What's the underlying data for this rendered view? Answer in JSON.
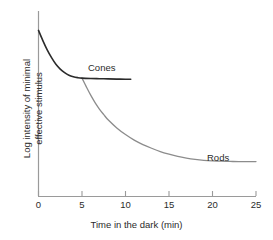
{
  "chart_data": {
    "type": "line",
    "title": "",
    "xlabel": "Time in the dark (min)",
    "ylabel": "Log intensity of minimal effective stimulus",
    "ylabel_line1": "Log intensity of minimal",
    "ylabel_line2": "effective stimulus",
    "xlim": [
      0,
      25
    ],
    "ylim": [
      0,
      1
    ],
    "xticks": [
      0,
      5,
      10,
      15,
      20,
      25
    ],
    "xtick_labels": [
      "0",
      "5",
      "10",
      "15",
      "20",
      "25"
    ],
    "yticks": [],
    "ytick_labels": [],
    "grid": false,
    "legend": "inline-annotations",
    "annotations": [
      {
        "text": "Cones",
        "x": 6.0,
        "y": 0.78
      },
      {
        "text": "Rods",
        "x": 20.3,
        "y": 0.3
      }
    ],
    "series": [
      {
        "name": "Cones",
        "color": "#2b2b2b",
        "x": [
          0,
          0.5,
          1,
          1.5,
          2,
          2.5,
          3,
          3.5,
          4,
          4.5,
          5,
          6,
          7,
          8,
          9,
          10,
          10.6
        ],
        "y": [
          0.895,
          0.84,
          0.79,
          0.748,
          0.712,
          0.686,
          0.667,
          0.653,
          0.645,
          0.64,
          0.637,
          0.635,
          0.634,
          0.633,
          0.632,
          0.631,
          0.631
        ]
      },
      {
        "name": "Rods",
        "color": "#8c8c8c",
        "x": [
          5,
          5.5,
          6,
          6.5,
          7,
          7.5,
          8,
          9,
          10,
          11,
          12,
          13,
          14,
          15,
          16,
          17,
          18,
          19,
          20,
          21,
          22,
          23,
          24,
          25
        ],
        "y": [
          0.637,
          0.59,
          0.545,
          0.505,
          0.47,
          0.44,
          0.412,
          0.368,
          0.332,
          0.302,
          0.278,
          0.258,
          0.24,
          0.226,
          0.214,
          0.205,
          0.198,
          0.193,
          0.19,
          0.188,
          0.187,
          0.186,
          0.186,
          0.186
        ]
      }
    ],
    "axis_color": "#9a9a9a"
  }
}
